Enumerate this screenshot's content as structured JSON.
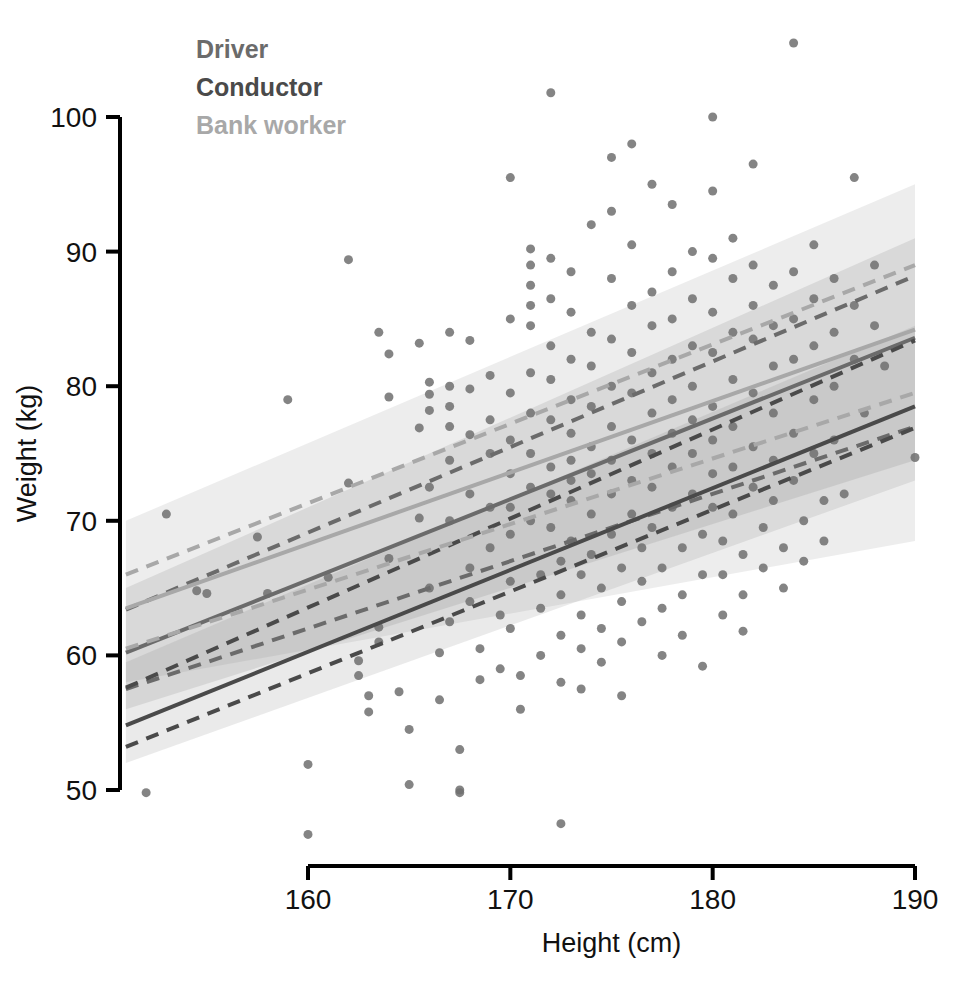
{
  "figure": {
    "kind": "scatter-with-regression",
    "background": "#ffffff"
  },
  "legend": {
    "position": "top-left-inside",
    "items": [
      {
        "label": "Driver",
        "color": "#6b6b6b"
      },
      {
        "label": "Conductor",
        "color": "#4a4a4a"
      },
      {
        "label": "Bank worker",
        "color": "#a8a8a8"
      }
    ]
  },
  "axes": {
    "x": {
      "title": "Height (cm)",
      "ticks": [
        160,
        170,
        180,
        190
      ],
      "min": 160,
      "max": 190
    },
    "y": {
      "title": "Weight (kg)",
      "ticks": [
        50,
        60,
        70,
        80,
        90,
        100
      ],
      "min": 50,
      "max": 100
    }
  },
  "caption": {
    "partial_text": ""
  },
  "chart_data": {
    "type": "scatter",
    "title": "",
    "xlabel": "Height (cm)",
    "ylabel": "Weight (kg)",
    "xlim": [
      151,
      190
    ],
    "ylim": [
      45,
      106
    ],
    "xticks": [
      160,
      170,
      180,
      190
    ],
    "yticks": [
      50,
      60,
      70,
      80,
      90,
      100
    ],
    "grid": false,
    "legend_position": "upper left",
    "marker": {
      "shape": "circle",
      "size_px": 9,
      "color": "#6e6e6e",
      "opacity": 0.85
    },
    "series": [
      {
        "name": "Driver",
        "color": "#6b6b6b",
        "fit": {
          "style": "solid",
          "x": [
            151,
            190
          ],
          "y": [
            60.2,
            83.6
          ]
        },
        "bounds": {
          "style": "dashed",
          "lower": {
            "x": [
              151,
              190
            ],
            "y": [
              57.5,
              77.0
            ]
          },
          "upper": {
            "x": [
              151,
              190
            ],
            "y": [
              63.4,
              88.2
            ]
          }
        },
        "band": {
          "opacity": 0.18,
          "x": [
            151,
            190
          ],
          "lower": [
            56.0,
            74.5
          ],
          "upper": [
            65.0,
            91.0
          ]
        }
      },
      {
        "name": "Conductor",
        "color": "#4a4a4a",
        "fit": {
          "style": "solid",
          "x": [
            151,
            190
          ],
          "y": [
            54.8,
            78.5
          ]
        },
        "bounds": {
          "style": "dashed",
          "lower": {
            "x": [
              151,
              190
            ],
            "y": [
              53.2,
              76.9
            ]
          },
          "upper": {
            "x": [
              151,
              190
            ],
            "y": [
              57.6,
              83.4
            ]
          }
        },
        "band": {
          "opacity": 0.16,
          "x": [
            151,
            190
          ],
          "lower": [
            52.0,
            73.0
          ],
          "upper": [
            59.5,
            84.5
          ]
        }
      },
      {
        "name": "Bank worker",
        "color": "#a8a8a8",
        "fit": {
          "style": "solid",
          "x": [
            151,
            190
          ],
          "y": [
            63.5,
            84.2
          ]
        },
        "bounds": {
          "style": "dashed",
          "lower": {
            "x": [
              151,
              190
            ],
            "y": [
              60.5,
              79.5
            ]
          },
          "upper": {
            "x": [
              151,
              190
            ],
            "y": [
              66.0,
              89.0
            ]
          }
        },
        "band": {
          "opacity": 0.14,
          "x": [
            151,
            190
          ],
          "lower": [
            58.0,
            68.5
          ],
          "upper": [
            70.0,
            95.0
          ]
        }
      }
    ],
    "points": [
      [
        152.0,
        49.8
      ],
      [
        153.0,
        70.5
      ],
      [
        154.5,
        64.8
      ],
      [
        155.0,
        64.6
      ],
      [
        157.5,
        68.8
      ],
      [
        158.0,
        64.6
      ],
      [
        159.0,
        79.0
      ],
      [
        160.0,
        51.9
      ],
      [
        160.0,
        46.7
      ],
      [
        161.0,
        65.8
      ],
      [
        162.0,
        89.4
      ],
      [
        162.0,
        72.8
      ],
      [
        162.5,
        59.6
      ],
      [
        162.5,
        58.5
      ],
      [
        163.0,
        57.0
      ],
      [
        163.0,
        55.8
      ],
      [
        163.5,
        84.0
      ],
      [
        163.5,
        62.1
      ],
      [
        163.5,
        61.0
      ],
      [
        164.0,
        82.4
      ],
      [
        164.0,
        79.2
      ],
      [
        164.0,
        67.2
      ],
      [
        164.5,
        57.3
      ],
      [
        165.0,
        54.5
      ],
      [
        165.0,
        50.4
      ],
      [
        165.5,
        83.2
      ],
      [
        165.5,
        76.9
      ],
      [
        165.5,
        70.2
      ],
      [
        166.0,
        80.3
      ],
      [
        166.0,
        79.4
      ],
      [
        166.0,
        78.2
      ],
      [
        166.0,
        72.5
      ],
      [
        166.0,
        65.0
      ],
      [
        166.5,
        60.2
      ],
      [
        166.5,
        56.7
      ],
      [
        167.0,
        84.0
      ],
      [
        167.0,
        80.0
      ],
      [
        167.0,
        78.5
      ],
      [
        167.0,
        77.0
      ],
      [
        167.0,
        74.5
      ],
      [
        167.0,
        70.0
      ],
      [
        167.0,
        62.5
      ],
      [
        167.5,
        53.0
      ],
      [
        167.5,
        50.0
      ],
      [
        167.5,
        49.8
      ],
      [
        168.0,
        83.4
      ],
      [
        168.0,
        79.8
      ],
      [
        168.0,
        76.4
      ],
      [
        168.0,
        72.0
      ],
      [
        168.0,
        66.5
      ],
      [
        168.0,
        64.0
      ],
      [
        168.5,
        60.5
      ],
      [
        168.5,
        58.2
      ],
      [
        169.0,
        80.8
      ],
      [
        169.0,
        77.5
      ],
      [
        169.0,
        75.0
      ],
      [
        169.0,
        71.0
      ],
      [
        169.0,
        68.0
      ],
      [
        169.5,
        63.0
      ],
      [
        169.5,
        59.0
      ],
      [
        170.0,
        95.5
      ],
      [
        170.0,
        85.0
      ],
      [
        170.0,
        79.5
      ],
      [
        170.0,
        76.0
      ],
      [
        170.0,
        73.5
      ],
      [
        170.0,
        71.0
      ],
      [
        170.0,
        69.0
      ],
      [
        170.0,
        65.5
      ],
      [
        170.0,
        62.0
      ],
      [
        170.5,
        58.5
      ],
      [
        170.5,
        56.0
      ],
      [
        171.0,
        90.2
      ],
      [
        171.0,
        89.0
      ],
      [
        171.0,
        87.5
      ],
      [
        171.0,
        86.0
      ],
      [
        171.0,
        84.5
      ],
      [
        171.0,
        81.0
      ],
      [
        171.0,
        78.0
      ],
      [
        171.0,
        75.0
      ],
      [
        171.0,
        72.5
      ],
      [
        171.0,
        70.0
      ],
      [
        171.5,
        66.0
      ],
      [
        171.5,
        63.5
      ],
      [
        171.5,
        60.0
      ],
      [
        172.0,
        101.8
      ],
      [
        172.0,
        89.5
      ],
      [
        172.0,
        86.5
      ],
      [
        172.0,
        83.0
      ],
      [
        172.0,
        80.5
      ],
      [
        172.0,
        77.5
      ],
      [
        172.0,
        74.0
      ],
      [
        172.0,
        72.0
      ],
      [
        172.0,
        69.5
      ],
      [
        172.5,
        67.0
      ],
      [
        172.5,
        64.5
      ],
      [
        172.5,
        61.5
      ],
      [
        172.5,
        58.0
      ],
      [
        172.5,
        47.5
      ],
      [
        173.0,
        88.5
      ],
      [
        173.0,
        85.5
      ],
      [
        173.0,
        82.0
      ],
      [
        173.0,
        79.0
      ],
      [
        173.0,
        76.5
      ],
      [
        173.0,
        74.5
      ],
      [
        173.0,
        73.0
      ],
      [
        173.0,
        71.5
      ],
      [
        173.0,
        68.5
      ],
      [
        173.5,
        66.0
      ],
      [
        173.5,
        63.0
      ],
      [
        173.5,
        60.5
      ],
      [
        173.5,
        57.5
      ],
      [
        174.0,
        92.0
      ],
      [
        174.0,
        84.0
      ],
      [
        174.0,
        81.5
      ],
      [
        174.0,
        78.5
      ],
      [
        174.0,
        75.5
      ],
      [
        174.0,
        73.5
      ],
      [
        174.0,
        70.5
      ],
      [
        174.0,
        67.5
      ],
      [
        174.5,
        65.0
      ],
      [
        174.5,
        62.0
      ],
      [
        174.5,
        59.5
      ],
      [
        175.0,
        97.0
      ],
      [
        175.0,
        93.0
      ],
      [
        175.0,
        88.0
      ],
      [
        175.0,
        83.5
      ],
      [
        175.0,
        80.0
      ],
      [
        175.0,
        77.0
      ],
      [
        175.0,
        74.5
      ],
      [
        175.0,
        72.0
      ],
      [
        175.0,
        69.0
      ],
      [
        175.5,
        66.5
      ],
      [
        175.5,
        64.0
      ],
      [
        175.5,
        61.0
      ],
      [
        175.5,
        57.0
      ],
      [
        176.0,
        98.0
      ],
      [
        176.0,
        90.5
      ],
      [
        176.0,
        86.0
      ],
      [
        176.0,
        82.5
      ],
      [
        176.0,
        79.5
      ],
      [
        176.0,
        76.0
      ],
      [
        176.0,
        73.0
      ],
      [
        176.0,
        70.5
      ],
      [
        176.5,
        68.0
      ],
      [
        176.5,
        65.5
      ],
      [
        176.5,
        62.5
      ],
      [
        177.0,
        95.0
      ],
      [
        177.0,
        87.0
      ],
      [
        177.0,
        84.5
      ],
      [
        177.0,
        81.0
      ],
      [
        177.0,
        78.0
      ],
      [
        177.0,
        75.0
      ],
      [
        177.0,
        72.5
      ],
      [
        177.0,
        69.5
      ],
      [
        177.5,
        66.5
      ],
      [
        177.5,
        63.5
      ],
      [
        177.5,
        60.0
      ],
      [
        178.0,
        93.5
      ],
      [
        178.0,
        88.5
      ],
      [
        178.0,
        85.0
      ],
      [
        178.0,
        82.0
      ],
      [
        178.0,
        79.0
      ],
      [
        178.0,
        76.5
      ],
      [
        178.0,
        74.0
      ],
      [
        178.0,
        71.0
      ],
      [
        178.5,
        68.0
      ],
      [
        178.5,
        64.5
      ],
      [
        178.5,
        61.5
      ],
      [
        179.0,
        90.0
      ],
      [
        179.0,
        86.5
      ],
      [
        179.0,
        83.0
      ],
      [
        179.0,
        80.0
      ],
      [
        179.0,
        77.5
      ],
      [
        179.0,
        75.0
      ],
      [
        179.0,
        72.0
      ],
      [
        179.5,
        69.0
      ],
      [
        179.5,
        66.0
      ],
      [
        179.5,
        59.2
      ],
      [
        180.0,
        100.0
      ],
      [
        180.0,
        94.5
      ],
      [
        180.0,
        89.5
      ],
      [
        180.0,
        85.5
      ],
      [
        180.0,
        82.5
      ],
      [
        180.0,
        78.5
      ],
      [
        180.0,
        76.0
      ],
      [
        180.0,
        73.5
      ],
      [
        180.0,
        71.0
      ],
      [
        180.5,
        68.5
      ],
      [
        180.5,
        66.0
      ],
      [
        180.5,
        63.0
      ],
      [
        181.0,
        91.0
      ],
      [
        181.0,
        88.0
      ],
      [
        181.0,
        84.0
      ],
      [
        181.0,
        80.5
      ],
      [
        181.0,
        77.0
      ],
      [
        181.0,
        74.0
      ],
      [
        181.0,
        70.5
      ],
      [
        181.5,
        67.5
      ],
      [
        181.5,
        64.5
      ],
      [
        181.5,
        61.8
      ],
      [
        182.0,
        96.5
      ],
      [
        182.0,
        89.0
      ],
      [
        182.0,
        86.0
      ],
      [
        182.0,
        83.5
      ],
      [
        182.0,
        79.5
      ],
      [
        182.0,
        75.5
      ],
      [
        182.0,
        72.5
      ],
      [
        182.5,
        69.5
      ],
      [
        182.5,
        66.5
      ],
      [
        183.0,
        87.5
      ],
      [
        183.0,
        84.5
      ],
      [
        183.0,
        81.5
      ],
      [
        183.0,
        78.0
      ],
      [
        183.0,
        74.5
      ],
      [
        183.0,
        71.5
      ],
      [
        183.5,
        68.0
      ],
      [
        183.5,
        65.0
      ],
      [
        184.0,
        105.5
      ],
      [
        184.0,
        88.5
      ],
      [
        184.0,
        85.0
      ],
      [
        184.0,
        82.0
      ],
      [
        184.0,
        76.5
      ],
      [
        184.0,
        73.0
      ],
      [
        184.5,
        70.0
      ],
      [
        184.5,
        67.0
      ],
      [
        185.0,
        90.5
      ],
      [
        185.0,
        86.5
      ],
      [
        185.0,
        83.0
      ],
      [
        185.0,
        79.0
      ],
      [
        185.0,
        75.0
      ],
      [
        185.5,
        71.5
      ],
      [
        185.5,
        68.5
      ],
      [
        186.0,
        88.0
      ],
      [
        186.0,
        84.0
      ],
      [
        186.0,
        80.0
      ],
      [
        186.0,
        76.0
      ],
      [
        186.5,
        72.0
      ],
      [
        187.0,
        95.5
      ],
      [
        187.0,
        86.0
      ],
      [
        187.0,
        82.0
      ],
      [
        187.5,
        78.0
      ],
      [
        188.0,
        89.0
      ],
      [
        188.0,
        84.5
      ],
      [
        188.5,
        81.5
      ],
      [
        190.0,
        74.7
      ]
    ]
  }
}
